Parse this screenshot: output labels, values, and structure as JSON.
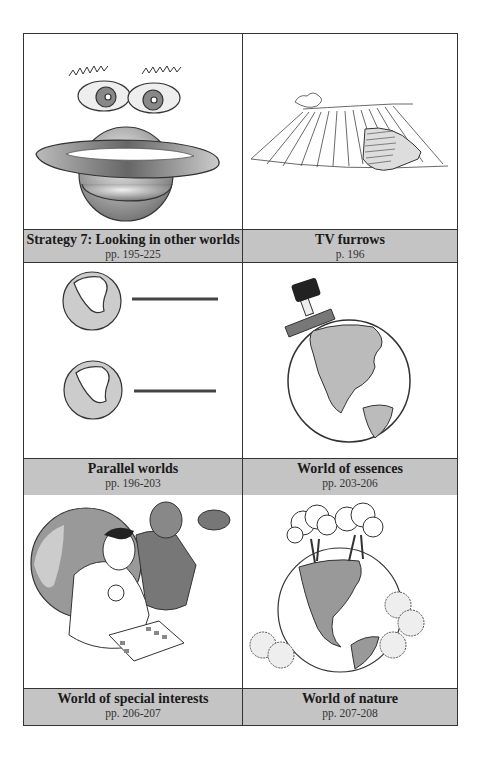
{
  "panels": [
    {
      "title": "Strategy 7: Looking in other worlds",
      "pages": "pp. 195-225",
      "illustration": "saturn-with-eyes"
    },
    {
      "title": "TV furrows",
      "pages": "p. 196",
      "illustration": "tv-in-plowed-field"
    },
    {
      "title": "Parallel worlds",
      "pages": "pp. 196-203",
      "illustration": "two-globes-with-lines"
    },
    {
      "title": "World of essences",
      "pages": "pp. 203-206",
      "illustration": "globe-with-stamp"
    },
    {
      "title": "World of special interests",
      "pages": "pp. 206-207",
      "illustration": "stamp-collector-and-football-player"
    },
    {
      "title": "World of nature",
      "pages": "pp. 207-208",
      "illustration": "globe-with-trees-and-shrubs"
    }
  ],
  "colors": {
    "caption_bg": "#c4c4c4",
    "border": "#333333"
  }
}
